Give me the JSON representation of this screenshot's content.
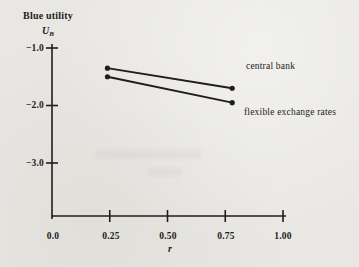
{
  "figure": {
    "y_axis_title": "Blue utility",
    "y_axis_symbol": "U",
    "y_axis_symbol_sub": "B",
    "x_axis_label": "r"
  },
  "chart_data": {
    "type": "line",
    "title": "",
    "xlabel": "r",
    "ylabel": "Blue utility U_B",
    "xlim": [
      0,
      1.0
    ],
    "ylim": [
      -3.9,
      -1.0
    ],
    "grid": false,
    "x_ticks": [
      0,
      0.25,
      0.5,
      0.75,
      1.0
    ],
    "x_tick_labels": [
      "0.0",
      "0.25",
      "0.50",
      "0.75",
      "1.00"
    ],
    "y_ticks": [
      -1.0,
      -2.0,
      -3.0
    ],
    "y_tick_labels": [
      "−1.0",
      "−2.0",
      "−3.0"
    ],
    "series": [
      {
        "name": "central bank",
        "x": [
          0.24,
          0.78
        ],
        "y": [
          -1.35,
          -1.7
        ]
      },
      {
        "name": "flexible exchange rates",
        "x": [
          0.24,
          0.78
        ],
        "y": [
          -1.5,
          -1.95
        ]
      }
    ],
    "legend_position": "right-of-lines",
    "marker": "filled-dot-endpoints",
    "line_color": "#1f1e1c",
    "background_color": "#e8e7e3"
  }
}
